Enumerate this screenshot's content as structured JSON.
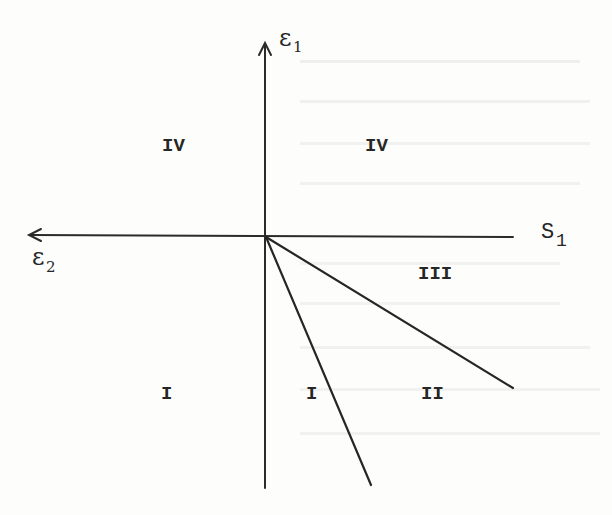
{
  "figure": {
    "axes": {
      "vertical": {
        "label": "ε",
        "subscript": "1",
        "arrow": "up"
      },
      "horizontal_left": {
        "label": "ε",
        "subscript": "2",
        "arrow": "left"
      },
      "horizontal_right": {
        "label": "S",
        "subscript": "1"
      }
    },
    "rays": [
      {
        "name": "steep-ray",
        "direction": "down-right, steep"
      },
      {
        "name": "shallow-ray",
        "direction": "down-right, shallow"
      }
    ],
    "regions": [
      {
        "id": "upper-left",
        "label": "IV"
      },
      {
        "id": "upper-right",
        "label": "IV"
      },
      {
        "id": "right-upper-wedge",
        "label": "III"
      },
      {
        "id": "lower-left",
        "label": "I"
      },
      {
        "id": "lower-middle",
        "label": "I"
      },
      {
        "id": "lower-right-wedge",
        "label": "II"
      }
    ]
  },
  "colors": {
    "ink": "#262626",
    "paper": "#fdfdfc",
    "bleed_through": "#d8d8d6"
  }
}
